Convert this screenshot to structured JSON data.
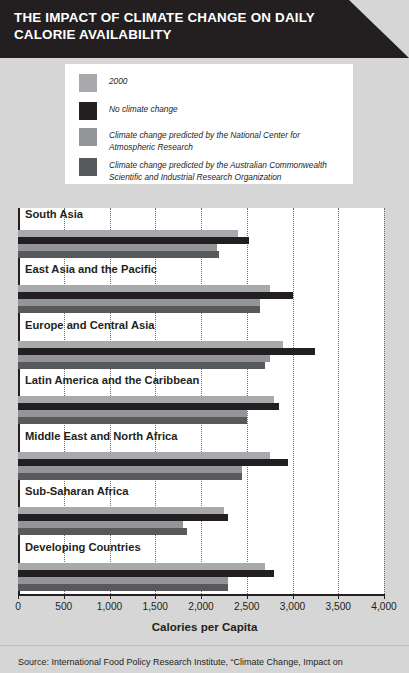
{
  "header": {
    "title": "THE IMPACT OF CLIMATE CHANGE ON DAILY\nCALORIE AVAILABILITY",
    "background_color": "#231f20",
    "text_color": "#ffffff"
  },
  "legend": {
    "position": "top",
    "items": [
      {
        "label": "2000",
        "color": "#a7a9ac"
      },
      {
        "label": "No climate change",
        "color": "#231f20"
      },
      {
        "label": "Climate change predicted by the National Center for\nAtmospheric Research",
        "color": "#939598"
      },
      {
        "label": "Climate change predicted by the Australian Commonwealth\nScientific and Industrial Research Organization",
        "color": "#58595b"
      }
    ]
  },
  "chart_data": {
    "type": "bar",
    "orientation": "horizontal",
    "title": "THE IMPACT OF CLIMATE CHANGE ON DAILY CALORIE AVAILABILITY",
    "xlabel": "Calories per Capita",
    "ylabel": "",
    "xlim": [
      0,
      4000
    ],
    "xticks": [
      0,
      500,
      1000,
      1500,
      2000,
      2500,
      3000,
      3500,
      4000
    ],
    "xtick_labels": [
      "0",
      "500",
      "1,000",
      "1,500",
      "2,000",
      "2,500",
      "3,000",
      "3,500",
      "4,000"
    ],
    "grid": true,
    "legend_position": "top",
    "categories": [
      "South Asia",
      "East Asia and the Pacific",
      "Europe and Central Asia",
      "Latin America and the Caribbean",
      "Middle East and North Africa",
      "Sub-Saharan Africa",
      "Developing Countries"
    ],
    "series": [
      {
        "name": "2000",
        "color": "#a7a9ac",
        "values": [
          2400,
          2750,
          2900,
          2800,
          2750,
          2250,
          2700
        ]
      },
      {
        "name": "No climate change",
        "color": "#231f20",
        "values": [
          2520,
          3000,
          3250,
          2850,
          2950,
          2300,
          2800
        ]
      },
      {
        "name": "Climate change predicted by the National Center for Atmospheric Research",
        "color": "#939598",
        "values": [
          2170,
          2650,
          2750,
          2500,
          2450,
          1800,
          2300
        ]
      },
      {
        "name": "Climate change predicted by the Australian Commonwealth Scientific and Industrial Research Organization",
        "color": "#58595b",
        "values": [
          2200,
          2650,
          2700,
          2500,
          2450,
          1850,
          2300
        ]
      }
    ]
  },
  "source": {
    "text": "Source: International Food Policy Research Institute, “Climate Change, Impact on"
  }
}
